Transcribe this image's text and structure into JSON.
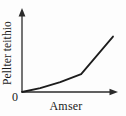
{
  "chart_data": {
    "type": "line",
    "title": "",
    "subtitle": "",
    "xlabel": "Amser",
    "ylabel": "Pellter teithio",
    "origin_label": "0",
    "grid": false,
    "legend": null,
    "legend_position": "none",
    "x_tick_labels": [],
    "y_tick_labels": [],
    "xlim": [
      0,
      100
    ],
    "ylim": [
      0,
      100
    ],
    "axis_arrows": {
      "x_axis_arrow": "arrow-right",
      "y_axis_arrow": "arrow-up"
    },
    "series": [
      {
        "name": "Pellter teithio yn erbyn amser",
        "x": [
          0,
          20,
          42,
          65,
          100
        ],
        "y": [
          0,
          6,
          15,
          27,
          84
        ]
      }
    ],
    "annotations": [],
    "colors": {
      "curve": "#1c1c1c",
      "axis": "#2b2b2b",
      "text": "#1a1a1a",
      "background": "#fdfdfd"
    }
  },
  "figure": {
    "caption": ""
  }
}
